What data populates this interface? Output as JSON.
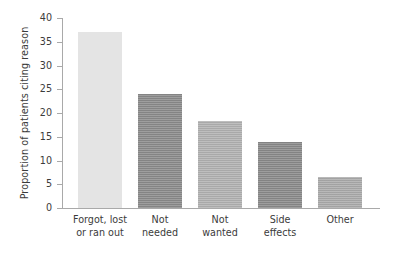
{
  "chart_data": {
    "type": "bar",
    "title": "",
    "subtitle": "",
    "xlabel": "",
    "ylabel": "Proportion of patients citing reason",
    "categories": [
      "Forgot, lost or ran out",
      "Not needed",
      "Not wanted",
      "Side effects",
      "Other"
    ],
    "category_lines": [
      [
        "Forgot, lost",
        "or ran out"
      ],
      [
        "Not",
        "needed"
      ],
      [
        "Not",
        "wanted"
      ],
      [
        "Side",
        "effects"
      ],
      [
        "Other",
        ""
      ]
    ],
    "values": [
      37.0,
      24.1,
      18.4,
      13.8,
      6.6
    ],
    "ylim": [
      0,
      40
    ],
    "ytick_labels": [
      "0",
      "5",
      "10",
      "15",
      "20",
      "25",
      "30",
      "35",
      "40"
    ],
    "ytick_values": [
      0,
      5,
      10,
      15,
      20,
      25,
      30,
      35,
      40
    ],
    "grid": false,
    "legend": "none",
    "bar_colors": [
      "#e4e4e4",
      "#8b8b8b",
      "#b2b2b2",
      "#8a8a8a",
      "#ababab"
    ],
    "axis_color": "#a9a9a9",
    "text_color": "#3b3b3b",
    "background": "#ffffff"
  }
}
